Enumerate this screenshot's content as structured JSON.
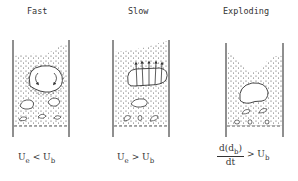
{
  "diagram": {
    "panels": [
      {
        "title": "Fast",
        "condition": {
          "lhs": "U",
          "lhs_sub": "e",
          "op": "<",
          "rhs": "U",
          "rhs_sub": "b"
        },
        "description": "Large bubble with internal circulation arrows, particles above, smaller bubbles below"
      },
      {
        "title": "Slow",
        "condition": {
          "lhs": "U",
          "lhs_sub": "e",
          "op": ">",
          "rhs": "U",
          "rhs_sub": "b"
        },
        "description": "Elongated bubble with gas streaming vertically through it, particles distributed throughout"
      },
      {
        "title": "Exploding",
        "condition": {
          "num": "d(d",
          "num_sub": "b",
          "num_close": ")",
          "den": "dt",
          "op": ">",
          "rhs": "U",
          "rhs_sub": "b"
        },
        "description": "Bed surface deformed upward by rapidly growing bubble"
      }
    ],
    "colors": {
      "line": "#333333",
      "particle": "#444444",
      "background": "#ffffff"
    }
  }
}
